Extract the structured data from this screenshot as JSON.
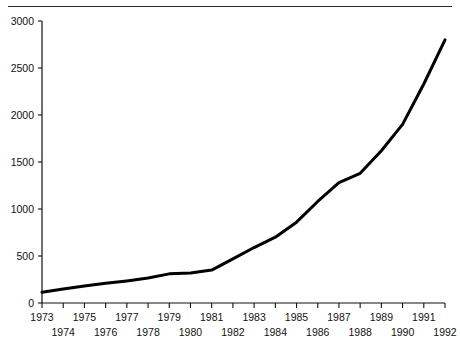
{
  "figure": {
    "top_caption": "",
    "background_color": "#ffffff"
  },
  "chart_data": {
    "type": "line",
    "title": "",
    "subtitle": "",
    "xlabel": "",
    "ylabel": "",
    "x": [
      1973,
      1974,
      1975,
      1976,
      1977,
      1978,
      1979,
      1980,
      1981,
      1982,
      1983,
      1984,
      1985,
      1986,
      1987,
      1988,
      1989,
      1990,
      1991,
      1992
    ],
    "values": [
      115,
      150,
      180,
      210,
      235,
      265,
      310,
      320,
      350,
      470,
      590,
      700,
      860,
      1080,
      1280,
      1380,
      1620,
      1900,
      2330,
      2800
    ],
    "series": [
      {
        "name": "series-1",
        "color": "#000000",
        "line_width": 3,
        "values": [
          115,
          150,
          180,
          210,
          235,
          265,
          310,
          320,
          350,
          470,
          590,
          700,
          860,
          1080,
          1280,
          1380,
          1620,
          1900,
          2330,
          2800
        ]
      }
    ],
    "xlim": [
      1973,
      1992
    ],
    "ylim": [
      0,
      3000
    ],
    "yticks": [
      0,
      500,
      1000,
      1500,
      2000,
      2500,
      3000
    ],
    "ytick_labels": [
      "0",
      "500",
      "1000",
      "1500",
      "2000",
      "2500",
      "3000"
    ],
    "xticks": [
      1973,
      1974,
      1975,
      1976,
      1977,
      1978,
      1979,
      1980,
      1981,
      1982,
      1983,
      1984,
      1985,
      1986,
      1987,
      1988,
      1989,
      1990,
      1991,
      1992
    ],
    "xtick_labels_top_row": [
      "1973",
      "1975",
      "1977",
      "1979",
      "1981",
      "1983",
      "1985",
      "1987",
      "1989",
      "1991"
    ],
    "xtick_labels_bottom_row": [
      "1974",
      "1976",
      "1978",
      "1980",
      "1982",
      "1984",
      "1986",
      "1988",
      "1990",
      "1992"
    ],
    "grid": false,
    "legend": null,
    "legend_position": "none",
    "annotations": []
  },
  "axes": {
    "y_axis_color": "#111111",
    "x_axis_color": "#111111",
    "line_color": "#000000"
  }
}
